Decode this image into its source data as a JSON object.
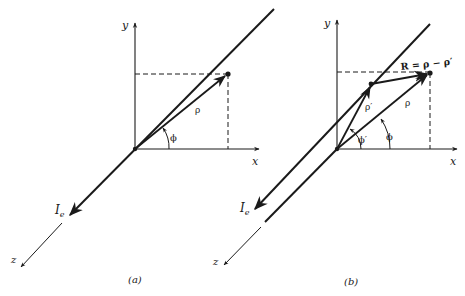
{
  "figure": {
    "panels": [
      {
        "id": "a",
        "caption": "(a)",
        "axes": {
          "x": "x",
          "y": "y",
          "z": "z"
        },
        "labels": {
          "current": "I",
          "current_sub": "e",
          "rho": "ρ",
          "phi": "ϕ"
        }
      },
      {
        "id": "b",
        "caption": "(b)",
        "axes": {
          "x": "x",
          "y": "y",
          "z": "z"
        },
        "labels": {
          "current": "I",
          "current_sub": "e",
          "rho": "ρ",
          "rho_prime": "ρ′",
          "phi": "ϕ",
          "phi_prime": "ϕ′",
          "R_eq": "R = ρ − ρ′"
        }
      }
    ],
    "colors": {
      "ink": "#1a1a1a",
      "background": "#ffffff"
    }
  }
}
